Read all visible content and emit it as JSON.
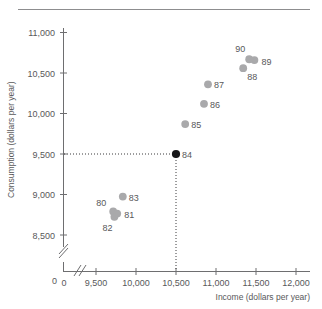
{
  "figure": {
    "top_rule": "horizontal-rule"
  },
  "chart_data": {
    "type": "scatter",
    "title": "",
    "xlabel": "Income (dollars per year)",
    "ylabel": "Consumption (dollars per year)",
    "xlim": [
      9250,
      12150
    ],
    "ylim": [
      8300,
      11150
    ],
    "xticks": [
      9500,
      10000,
      10500,
      11000,
      11500,
      12000
    ],
    "xtick_labels": [
      "9,500",
      "10,000",
      "10,500",
      "11,000",
      "11,500",
      "12,000"
    ],
    "yticks": [
      8500,
      9000,
      9500,
      10000,
      10500,
      11000
    ],
    "ytick_labels": [
      "8,500",
      "9,000",
      "9,500",
      "10,000",
      "10,500",
      "11,000"
    ],
    "x_origin_label": "0",
    "y_origin_label": "0",
    "axis_break": true,
    "grid": false,
    "legend": "none",
    "guides": {
      "x": 10500,
      "y": 9500,
      "style": "dotted",
      "point_label": "84"
    },
    "points": [
      {
        "label": "80",
        "x": 9715,
        "y": 8790,
        "highlight": false,
        "label_dx": -17,
        "label_dy": -6
      },
      {
        "label": "81",
        "x": 9765,
        "y": 8765,
        "highlight": false,
        "label_dx": 7,
        "label_dy": 4
      },
      {
        "label": "82",
        "x": 9730,
        "y": 8725,
        "highlight": false,
        "label_dx": -12,
        "label_dy": 14
      },
      {
        "label": "83",
        "x": 9835,
        "y": 8975,
        "highlight": false,
        "label_dx": 6,
        "label_dy": 4
      },
      {
        "label": "84",
        "x": 10500,
        "y": 9500,
        "highlight": true,
        "label_dx": 6,
        "label_dy": 4
      },
      {
        "label": "85",
        "x": 10615,
        "y": 9870,
        "highlight": false,
        "label_dx": 6,
        "label_dy": 4
      },
      {
        "label": "86",
        "x": 10850,
        "y": 10120,
        "highlight": false,
        "label_dx": 6,
        "label_dy": 4
      },
      {
        "label": "87",
        "x": 10900,
        "y": 10360,
        "highlight": false,
        "label_dx": 6,
        "label_dy": 4
      },
      {
        "label": "88",
        "x": 11340,
        "y": 10560,
        "highlight": false,
        "label_dx": 4,
        "label_dy": 12
      },
      {
        "label": "89",
        "x": 11480,
        "y": 10660,
        "highlight": false,
        "label_dx": 7,
        "label_dy": 5
      },
      {
        "label": "90",
        "x": 11415,
        "y": 10670,
        "highlight": false,
        "label_dx": -14,
        "label_dy": -7
      }
    ]
  }
}
